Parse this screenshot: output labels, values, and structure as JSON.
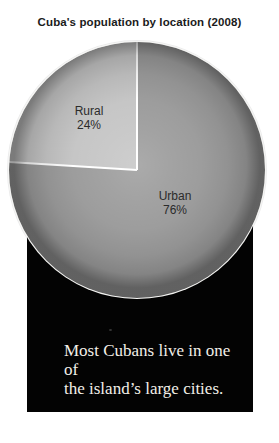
{
  "chart_data": {
    "type": "pie",
    "title": "Cuba's population by location (2008)",
    "slices": [
      {
        "label": "Urban",
        "value": 76,
        "percent_label": "76%",
        "color": "#9d9d9d"
      },
      {
        "label": "Rural",
        "value": 24,
        "percent_label": "24%",
        "color": "#c6c6c6"
      }
    ],
    "start_angle_deg": 0,
    "direction": "clockwise",
    "divider_color": "#ffffff",
    "legend": "none"
  },
  "caption": {
    "line1": "Most Cubans live in one of",
    "line2": "the island’s large cities.",
    "panel_color": "#030303",
    "text_color": "#f2efe8"
  }
}
